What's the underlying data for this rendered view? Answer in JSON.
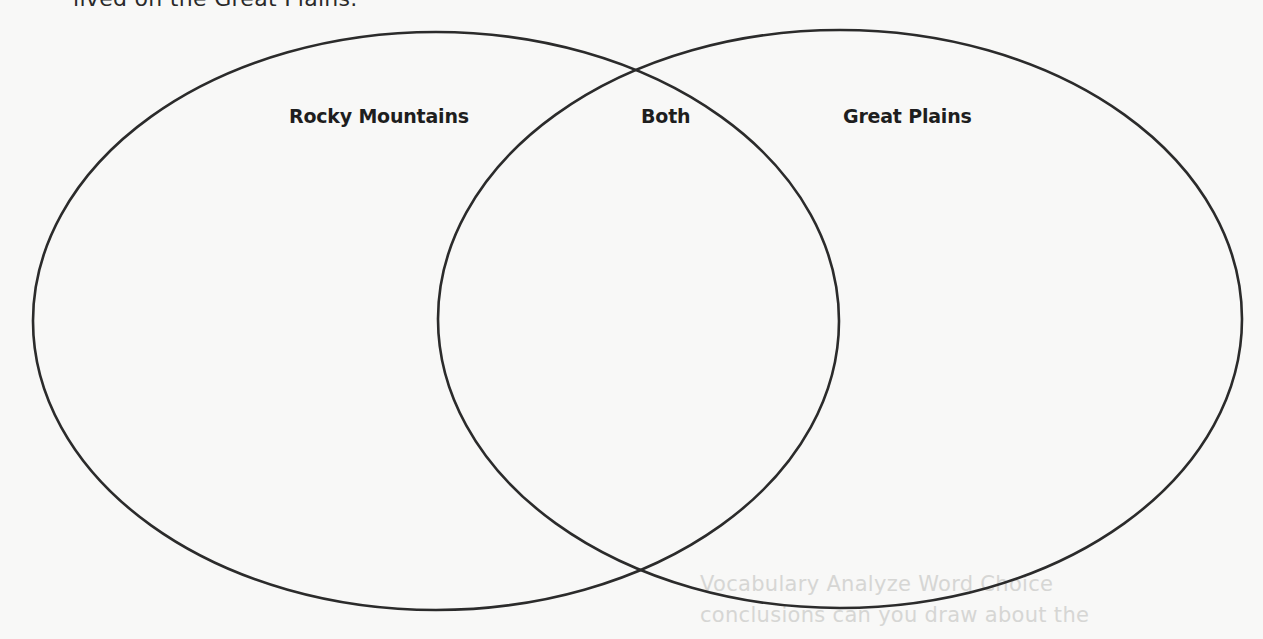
{
  "prompt": {
    "text": "lived on the Great Plains."
  },
  "diagram": {
    "type": "venn",
    "circles": [
      {
        "id": "left",
        "label": "Rocky Mountains"
      },
      {
        "id": "right",
        "label": "Great Plains"
      }
    ],
    "overlap_label": "Both",
    "stroke_color": "#2b2b2b",
    "background_color": "#f8f8f7"
  },
  "bleed_through": {
    "line1": "Vocabulary Analyze Word Choice",
    "line2": "conclusions can you draw about the"
  }
}
